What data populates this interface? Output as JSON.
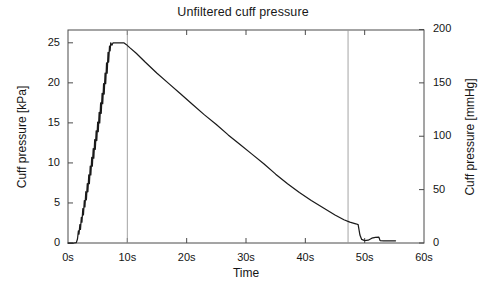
{
  "chart_data": {
    "type": "line",
    "title": "Unfiltered cuff pressure",
    "xlabel": "Time",
    "ylabel": "Cuff pressure [kPa]",
    "ylabel_right": "Cuff pressure [mmHg]",
    "grid": false,
    "legend": "none",
    "xlim": [
      0,
      60
    ],
    "ylim": [
      0,
      26.6
    ],
    "ylim_right": [
      0,
      200
    ],
    "x_tick_labels": [
      "0s",
      "10s",
      "20s",
      "30s",
      "40s",
      "50s",
      "60s"
    ],
    "x_tick_values": [
      0,
      10,
      20,
      30,
      40,
      50,
      60
    ],
    "y_tick_labels": [
      "0",
      "5",
      "10",
      "15",
      "20",
      "25"
    ],
    "y_tick_values": [
      0,
      5,
      10,
      15,
      20,
      25
    ],
    "y_right_tick_labels": [
      "0",
      "50",
      "100",
      "150",
      "200"
    ],
    "y_right_tick_values": [
      0,
      50,
      100,
      150,
      200
    ],
    "annotations": [
      {
        "name": "inflation-end-marker",
        "type": "vline",
        "x": 10.0
      },
      {
        "name": "deflation-end-marker",
        "type": "vline",
        "x": 47.2
      }
    ],
    "series": [
      {
        "name": "Unfiltered cuff pressure",
        "color": "#1a1a1a",
        "points": [
          [
            0.0,
            0.0
          ],
          [
            1.0,
            0.0
          ],
          [
            1.4,
            0.05
          ],
          [
            1.6,
            0.5
          ],
          [
            1.75,
            1.5
          ],
          [
            1.85,
            1.1
          ],
          [
            2.0,
            2.3
          ],
          [
            2.1,
            1.7
          ],
          [
            2.25,
            3.2
          ],
          [
            2.35,
            2.6
          ],
          [
            2.5,
            4.3
          ],
          [
            2.6,
            3.5
          ],
          [
            2.75,
            5.3
          ],
          [
            2.85,
            4.5
          ],
          [
            3.0,
            6.4
          ],
          [
            3.1,
            5.4
          ],
          [
            3.25,
            7.4
          ],
          [
            3.35,
            6.4
          ],
          [
            3.5,
            8.5
          ],
          [
            3.6,
            7.4
          ],
          [
            3.75,
            9.6
          ],
          [
            3.85,
            8.5
          ],
          [
            4.0,
            10.7
          ],
          [
            4.1,
            9.6
          ],
          [
            4.25,
            11.8
          ],
          [
            4.35,
            10.6
          ],
          [
            4.5,
            12.9
          ],
          [
            4.6,
            11.7
          ],
          [
            4.75,
            14.0
          ],
          [
            4.85,
            12.8
          ],
          [
            5.0,
            15.1
          ],
          [
            5.1,
            13.9
          ],
          [
            5.25,
            16.3
          ],
          [
            5.35,
            15.0
          ],
          [
            5.5,
            17.5
          ],
          [
            5.6,
            16.2
          ],
          [
            5.75,
            18.7
          ],
          [
            5.85,
            17.4
          ],
          [
            6.0,
            19.9
          ],
          [
            6.1,
            18.6
          ],
          [
            6.25,
            21.2
          ],
          [
            6.35,
            19.9
          ],
          [
            6.5,
            22.5
          ],
          [
            6.6,
            21.2
          ],
          [
            6.75,
            23.8
          ],
          [
            6.85,
            22.6
          ],
          [
            7.0,
            24.6
          ],
          [
            7.1,
            24.0
          ],
          [
            7.2,
            25.0
          ],
          [
            7.4,
            24.7
          ],
          [
            7.6,
            25.0
          ],
          [
            8.5,
            25.0
          ],
          [
            9.4,
            25.0
          ],
          [
            9.8,
            24.8
          ],
          [
            10.4,
            24.4
          ],
          [
            11.5,
            23.7
          ],
          [
            13.0,
            22.6
          ],
          [
            15.0,
            21.2
          ],
          [
            17.0,
            19.9
          ],
          [
            19.0,
            18.6
          ],
          [
            21.0,
            17.3
          ],
          [
            23.0,
            16.0
          ],
          [
            25.0,
            14.8
          ],
          [
            27.0,
            13.5
          ],
          [
            29.0,
            12.3
          ],
          [
            31.0,
            11.1
          ],
          [
            33.0,
            9.9
          ],
          [
            35.0,
            8.6
          ],
          [
            37.0,
            7.4
          ],
          [
            39.0,
            6.3
          ],
          [
            41.0,
            5.3
          ],
          [
            43.0,
            4.4
          ],
          [
            45.0,
            3.5
          ],
          [
            46.5,
            2.9
          ],
          [
            47.5,
            2.6
          ],
          [
            48.5,
            2.4
          ],
          [
            48.9,
            2.3
          ],
          [
            49.2,
            1.0
          ],
          [
            49.5,
            0.45
          ],
          [
            50.0,
            0.3
          ],
          [
            50.6,
            0.35
          ],
          [
            51.2,
            0.6
          ],
          [
            51.8,
            0.7
          ],
          [
            52.4,
            0.72
          ],
          [
            52.6,
            0.3
          ],
          [
            53.2,
            0.28
          ],
          [
            54.0,
            0.28
          ],
          [
            55.2,
            0.28
          ]
        ]
      }
    ]
  }
}
